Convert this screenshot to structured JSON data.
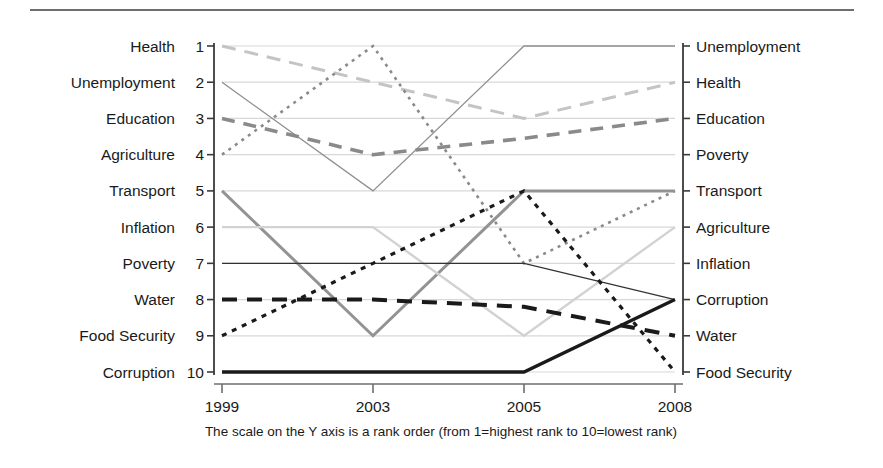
{
  "figure": {
    "caption": "The scale on the Y axis is a rank order (from 1=highest rank to 10=lowest rank)",
    "top_rule": "horizontal-rule"
  },
  "chart_data": {
    "type": "line",
    "title": "",
    "xlabel": "",
    "ylabel": "",
    "x": [
      "1999",
      "2003",
      "2005",
      "2008"
    ],
    "ylim": [
      1,
      10
    ],
    "y_inverted": true,
    "grid": true,
    "legend": "axis-labels",
    "y_ranks": [
      1,
      2,
      3,
      4,
      5,
      6,
      7,
      8,
      9,
      10
    ],
    "left_axis_labels": [
      "Health",
      "Unemployment",
      "Education",
      "Agriculture",
      "Transport",
      "Inflation",
      "Poverty",
      "Water",
      "Food Security",
      "Corruption"
    ],
    "right_axis_labels": [
      "Unemployment",
      "Health",
      "Education",
      "Poverty",
      "Transport",
      "Agriculture",
      "Inflation",
      "Corruption",
      "Water",
      "Food Security"
    ],
    "series": [
      {
        "name": "Health",
        "values": [
          1,
          2,
          3,
          2
        ],
        "color": "#c4c4c4",
        "width": 3.0,
        "dash": "14,9",
        "style": "long-dash"
      },
      {
        "name": "Unemployment",
        "values": [
          2,
          5,
          1,
          1
        ],
        "color": "#8f8f8f",
        "width": 1.3,
        "dash": "none",
        "style": "thin-solid"
      },
      {
        "name": "Education",
        "values": [
          3,
          4,
          3.55,
          3
        ],
        "color": "#8a8a8a",
        "width": 3.6,
        "dash": "13,9",
        "style": "medium-dash"
      },
      {
        "name": "Agriculture",
        "values": [
          4,
          1,
          7,
          5
        ],
        "color": "#8a8a8a",
        "width": 2.6,
        "dash": "3,5",
        "style": "dotted"
      },
      {
        "name": "Transport",
        "values": [
          5,
          9,
          5,
          5
        ],
        "color": "#939393",
        "width": 3.0,
        "dash": "none",
        "style": "thick-solid"
      },
      {
        "name": "Inflation",
        "values": [
          6,
          6,
          9,
          6
        ],
        "color": "#d2d2d2",
        "width": 2.4,
        "dash": "none",
        "style": "pale-solid"
      },
      {
        "name": "Poverty",
        "values": [
          7,
          7,
          7,
          8
        ],
        "color": "#333333",
        "width": 1.3,
        "dash": "none",
        "style": "thin-dark-solid"
      },
      {
        "name": "Water",
        "values": [
          8,
          8,
          8.2,
          9
        ],
        "color": "#1a1a1a",
        "width": 4.0,
        "dash": "15,10",
        "style": "black-dash"
      },
      {
        "name": "Food Security",
        "values": [
          9,
          7,
          5,
          10
        ],
        "color": "#1a1a1a",
        "width": 3.2,
        "dash": "5,6",
        "style": "black-dot"
      },
      {
        "name": "Corruption",
        "values": [
          10,
          10,
          10,
          8
        ],
        "color": "#1a1a1a",
        "width": 3.4,
        "dash": "none",
        "style": "black-solid"
      }
    ]
  }
}
